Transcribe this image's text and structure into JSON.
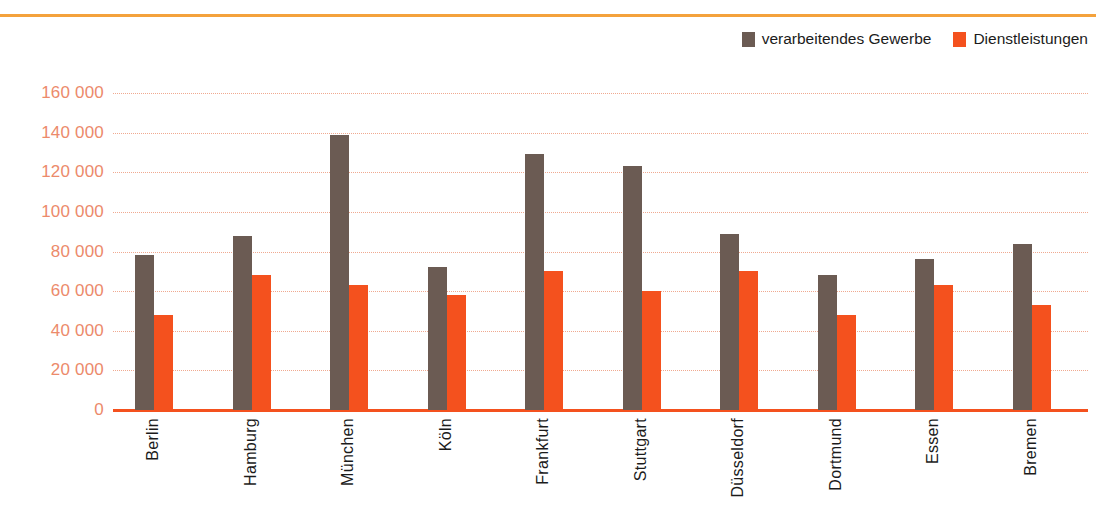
{
  "legend": {
    "position": "top-right",
    "items": [
      {
        "label": "verarbeitendes Gewerbe",
        "color": "#6B5B53",
        "swatch_name": "legend-swatch-manufacturing"
      },
      {
        "label": "Dienstleistungen",
        "color": "#F4511E",
        "swatch_name": "legend-swatch-services"
      }
    ]
  },
  "colors": {
    "series_manufacturing": "#6B5B53",
    "series_services": "#F4511E",
    "axis_text": "#EC8A6B",
    "gridline": "#F0A990",
    "baseline": "#F4511E",
    "top_rule": "#F4A23C",
    "label_text": "#1b1b1b",
    "background": "#FFFFFF"
  },
  "chart_data": {
    "type": "bar",
    "title": "",
    "subtitle": "",
    "xlabel": "",
    "ylabel": "",
    "ylim": [
      0,
      160000
    ],
    "ytick_labels": [
      "160 000",
      "140 000",
      "120 000",
      "100 000",
      "80 000",
      "60 000",
      "40 000",
      "20 000",
      "0"
    ],
    "ytick_values": [
      160000,
      140000,
      120000,
      100000,
      80000,
      60000,
      40000,
      20000,
      0
    ],
    "grid": true,
    "legend_position": "top-right",
    "categories": [
      "Berlin",
      "Hamburg",
      "München",
      "Köln",
      "Frankfurt",
      "Stuttgart",
      "Düsseldorf",
      "Dortmund",
      "Essen",
      "Bremen"
    ],
    "series": [
      {
        "name": "verarbeitendes Gewerbe",
        "color": "#6B5B53",
        "values": [
          78000,
          88000,
          139000,
          72000,
          129000,
          123000,
          89000,
          68000,
          76000,
          84000
        ]
      },
      {
        "name": "Dienstleistungen",
        "color": "#F4511E",
        "values": [
          48000,
          68000,
          63000,
          58000,
          70000,
          60000,
          70000,
          48000,
          63000,
          53000
        ]
      }
    ]
  }
}
